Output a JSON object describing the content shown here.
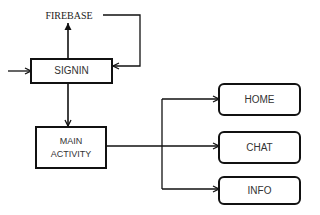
{
  "diagram": {
    "type": "flowchart",
    "nodes": [
      {
        "id": "firebase",
        "label": "FIREBASE",
        "shape": "text"
      },
      {
        "id": "signin",
        "label": "SIGNIN",
        "shape": "rectangle"
      },
      {
        "id": "main",
        "label_line1": "MAIN",
        "label_line2": "ACTIVITY",
        "shape": "rectangle"
      },
      {
        "id": "home",
        "label": "HOME",
        "shape": "rounded-rectangle"
      },
      {
        "id": "chat",
        "label": "CHAT",
        "shape": "rounded-rectangle"
      },
      {
        "id": "info",
        "label": "INFO",
        "shape": "rounded-rectangle"
      }
    ],
    "edges": [
      {
        "from": "entry",
        "to": "signin"
      },
      {
        "from": "signin",
        "to": "firebase"
      },
      {
        "from": "firebase",
        "to": "signin"
      },
      {
        "from": "signin",
        "to": "main"
      },
      {
        "from": "main",
        "to": "home"
      },
      {
        "from": "main",
        "to": "chat"
      },
      {
        "from": "main",
        "to": "info"
      }
    ],
    "colors": {
      "stroke": "#111111",
      "text": "#333333",
      "background": "#ffffff"
    }
  }
}
